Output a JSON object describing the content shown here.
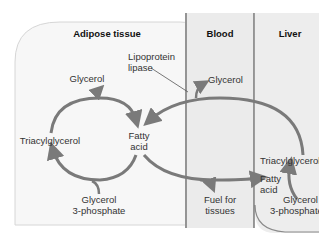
{
  "regions": {
    "adipose": {
      "title": "Adipose tissue"
    },
    "blood": {
      "title": "Blood"
    },
    "liver": {
      "title": "Liver"
    }
  },
  "adipose_labels": {
    "glycerol": "Glycerol",
    "triacylglycerol": "Triacylglycerol",
    "fatty_acid_1": "Fatty",
    "fatty_acid_2": "acid",
    "glycerol3p_1": "Glycerol",
    "glycerol3p_2": "3-phosphate",
    "lipoprotein_1": "Lipoprotein",
    "lipoprotein_2": "lipase"
  },
  "blood_labels": {
    "glycerol": "Glycerol",
    "fuel_1": "Fuel for",
    "fuel_2": "tissues"
  },
  "liver_labels": {
    "triacylglycerol": "Triacylglycerol",
    "fatty_acid_1": "Fatty",
    "fatty_acid_2": "acid",
    "glycerol3p_1": "Glycerol",
    "glycerol3p_2": "3-phosphate"
  },
  "colors": {
    "arrow": "#7a7a7a",
    "adipose_fill": "#f7f7f7",
    "blood_fill": "#ebebeb",
    "liver_fill": "#ededed",
    "divider": "#666666"
  }
}
